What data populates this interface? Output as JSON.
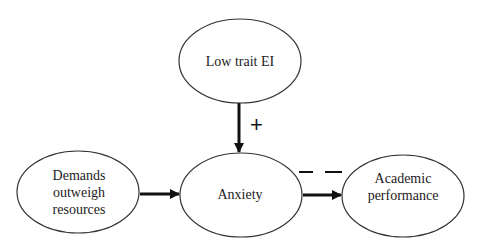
{
  "nodes": {
    "low_trait_ei": {
      "label": "Low trait EI"
    },
    "demands": {
      "line1": "Demands",
      "line2": "outweigh",
      "line3": "resources"
    },
    "anxiety": {
      "label": "Anxiety"
    },
    "academic": {
      "line1": "Academic",
      "line2": "performance"
    }
  },
  "edges": {
    "ei_to_anxiety": {
      "sign": "+"
    },
    "anxiety_to_academic": {
      "sign": "— —"
    }
  },
  "colors": {
    "stroke": "#222222",
    "background": "#ffffff"
  }
}
